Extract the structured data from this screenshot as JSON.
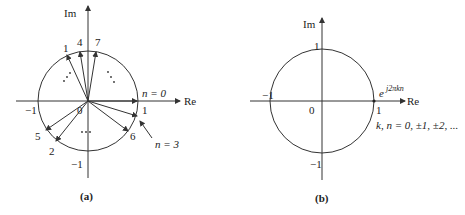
{
  "figure": {
    "panel_a": {
      "caption": "(a)",
      "axis_re": "Re",
      "axis_im": "Im",
      "tick_neg1_re": "−1",
      "tick_pos1_re": "1",
      "tick_neg1_im": "−1",
      "origin": "0",
      "label_n0": "n = 0",
      "label_n3": "n = 3",
      "vector_labels": [
        "1",
        "4",
        "7",
        "5",
        "2",
        "6"
      ],
      "ellipsis": "⋯"
    },
    "panel_b": {
      "caption": "(b)",
      "axis_re": "Re",
      "axis_im": "Im",
      "tick_pos1_im": "1",
      "tick_neg1_im": "−1",
      "tick_neg1_re": "−1",
      "tick_pos1_re": "1",
      "origin": "0",
      "exp_base": "e",
      "exp_power": "j2πkn",
      "index_note": "k, n = 0, ±1, ±2, ..."
    }
  }
}
